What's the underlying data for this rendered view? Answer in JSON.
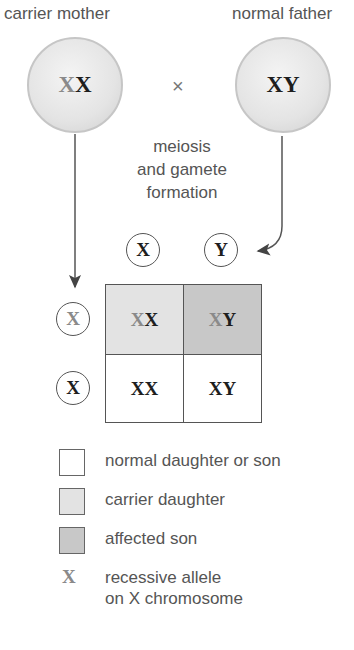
{
  "parents": {
    "mother": {
      "label": "carrier mother",
      "genotype": [
        "X",
        "X"
      ],
      "allele_types": [
        "recessive",
        "normal"
      ]
    },
    "father": {
      "label": "normal father",
      "genotype": [
        "X",
        "Y"
      ],
      "allele_types": [
        "normal",
        "normal"
      ]
    },
    "cross_symbol": "×"
  },
  "process_label": [
    "meiosis",
    "and gamete",
    "formation"
  ],
  "gametes": {
    "father": [
      {
        "allele": "X",
        "type": "normal"
      },
      {
        "allele": "Y",
        "type": "normal"
      }
    ],
    "mother": [
      {
        "allele": "X",
        "type": "recessive"
      },
      {
        "allele": "X",
        "type": "normal"
      }
    ]
  },
  "punnett_square": {
    "rows": [
      [
        {
          "alleles": [
            "X",
            "X"
          ],
          "types": [
            "recessive",
            "normal"
          ],
          "phenotype": "carrier daughter"
        },
        {
          "alleles": [
            "X",
            "Y"
          ],
          "types": [
            "recessive",
            "normal"
          ],
          "phenotype": "affected son"
        }
      ],
      [
        {
          "alleles": [
            "X",
            "X"
          ],
          "types": [
            "normal",
            "normal"
          ],
          "phenotype": "normal daughter"
        },
        {
          "alleles": [
            "X",
            "Y"
          ],
          "types": [
            "normal",
            "normal"
          ],
          "phenotype": "normal son"
        }
      ]
    ]
  },
  "legend": {
    "items": [
      {
        "label": "normal daughter or son",
        "color": "#ffffff"
      },
      {
        "label": "carrier daughter",
        "color": "#e3e3e3"
      },
      {
        "label": "affected son",
        "color": "#c8c8c8"
      }
    ],
    "allele_symbol": "X",
    "allele_line1": "recessive allele",
    "allele_line2": "on X chromosome"
  },
  "colors": {
    "recessive_allele": "#8a8a8a",
    "normal_allele": "#1e1e1e",
    "line": "#555555"
  }
}
